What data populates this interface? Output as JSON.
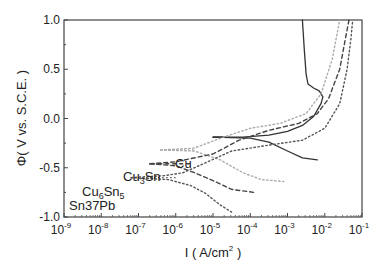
{
  "chart_data": {
    "type": "line",
    "title": "",
    "xlabel": "I ( A/cm2 )",
    "ylabel": "Φ( V vs. S.C.E. )",
    "xscale": "log",
    "xlim_log10": [
      -9,
      -1
    ],
    "ylim": [
      -1.0,
      1.0
    ],
    "x_tick_labels": [
      "10^-9",
      "10^-8",
      "10^-7",
      "10^-6",
      "10^-5",
      "10^-4",
      "10^-3",
      "10^-2",
      "10^-1"
    ],
    "y_tick_labels": [
      "-1.0",
      "-0.5",
      "0.0",
      "0.5",
      "1.0"
    ],
    "grid": false,
    "legend": "inline labels at left of each curve",
    "series": [
      {
        "name": "Cu",
        "style": "solid",
        "color": "#333333",
        "label_at": {
          "log10_i": -5.3,
          "phi": -0.19
        },
        "anodic": [
          [
            -5.0,
            -0.19
          ],
          [
            -4.2,
            -0.19
          ],
          [
            -3.5,
            -0.17
          ],
          [
            -3.0,
            -0.13
          ],
          [
            -2.6,
            -0.07
          ],
          [
            -2.3,
            0.02
          ],
          [
            -2.1,
            0.15
          ],
          [
            -2.05,
            0.22
          ],
          [
            -2.15,
            0.28
          ],
          [
            -2.3,
            0.31
          ],
          [
            -2.45,
            0.35
          ],
          [
            -2.5,
            0.45
          ],
          [
            -2.55,
            0.7
          ],
          [
            -2.6,
            1.0
          ]
        ],
        "cathodic": [
          [
            -5.0,
            -0.19
          ],
          [
            -4.0,
            -0.2
          ],
          [
            -3.5,
            -0.24
          ],
          [
            -3.0,
            -0.33
          ],
          [
            -2.6,
            -0.4
          ],
          [
            -2.2,
            -0.42
          ]
        ]
      },
      {
        "name": "Cu3Sn",
        "style": "dotted",
        "color": "#aaaaaa",
        "label_at": {
          "log10_i": -6.6,
          "phi": -0.32
        },
        "anodic": [
          [
            -6.4,
            -0.32
          ],
          [
            -5.5,
            -0.3
          ],
          [
            -4.8,
            -0.2
          ],
          [
            -4.0,
            -0.1
          ],
          [
            -3.2,
            -0.05
          ],
          [
            -2.5,
            0.05
          ],
          [
            -2.1,
            0.25
          ],
          [
            -1.8,
            0.6
          ],
          [
            -1.6,
            1.0
          ]
        ],
        "cathodic": [
          [
            -6.4,
            -0.32
          ],
          [
            -5.5,
            -0.33
          ],
          [
            -4.8,
            -0.42
          ],
          [
            -4.2,
            -0.55
          ],
          [
            -3.7,
            -0.62
          ],
          [
            -3.1,
            -0.64
          ]
        ]
      },
      {
        "name": "Cu6Sn5",
        "style": "dashed",
        "color": "#444444",
        "label_at": {
          "log10_i": -6.9,
          "phi": -0.46
        },
        "anodic": [
          [
            -6.7,
            -0.46
          ],
          [
            -6.0,
            -0.44
          ],
          [
            -5.0,
            -0.36
          ],
          [
            -4.3,
            -0.22
          ],
          [
            -3.5,
            -0.12
          ],
          [
            -2.7,
            -0.05
          ],
          [
            -2.2,
            0.05
          ],
          [
            -1.9,
            0.2
          ],
          [
            -1.6,
            0.5
          ],
          [
            -1.45,
            0.8
          ],
          [
            -1.35,
            1.0
          ]
        ],
        "cathodic": [
          [
            -6.7,
            -0.46
          ],
          [
            -6.0,
            -0.48
          ],
          [
            -5.5,
            -0.55
          ],
          [
            -5.0,
            -0.63
          ],
          [
            -4.5,
            -0.72
          ],
          [
            -3.9,
            -0.75
          ]
        ]
      },
      {
        "name": "Sn37Pb",
        "style": "dotted",
        "color": "#555555",
        "label_at": {
          "log10_i": -7.4,
          "phi": -0.6
        },
        "anodic": [
          [
            -7.2,
            -0.6
          ],
          [
            -6.3,
            -0.58
          ],
          [
            -5.8,
            -0.55
          ],
          [
            -5.2,
            -0.45
          ],
          [
            -4.5,
            -0.33
          ],
          [
            -3.5,
            -0.27
          ],
          [
            -2.6,
            -0.22
          ],
          [
            -2.0,
            -0.1
          ],
          [
            -1.6,
            0.15
          ],
          [
            -1.4,
            0.5
          ],
          [
            -1.3,
            0.8
          ],
          [
            -1.25,
            1.0
          ]
        ],
        "cathodic": [
          [
            -7.2,
            -0.6
          ],
          [
            -6.2,
            -0.62
          ],
          [
            -5.6,
            -0.68
          ],
          [
            -5.2,
            -0.76
          ],
          [
            -4.8,
            -0.88
          ],
          [
            -4.5,
            -0.95
          ]
        ]
      }
    ]
  },
  "axes": {
    "xlabel_main": "I ( A/cm",
    "xlabel_sup": "2",
    "xlabel_end": " )",
    "ylabel": "Φ( V vs. S.C.E. )"
  },
  "labels": {
    "cu": "Cu",
    "cu3sn_a": "Cu",
    "cu3sn_sub": "3",
    "cu3sn_b": "Sn",
    "cu6sn5_a": "Cu",
    "cu6sn5_sub1": "6",
    "cu6sn5_b": "Sn",
    "cu6sn5_sub2": "5",
    "sn37pb": "Sn37Pb"
  }
}
